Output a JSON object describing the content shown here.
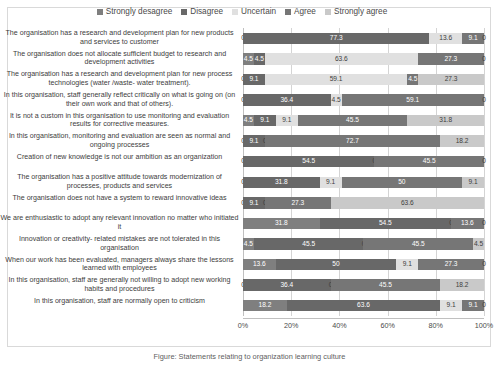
{
  "chart_data": {
    "type": "bar",
    "subtype": "stacked-horizontal-100-percent",
    "title": "",
    "xlabel": "",
    "ylabel": "",
    "xlim": [
      0,
      100
    ],
    "xticks": [
      "0%",
      "20%",
      "40%",
      "60%",
      "80%",
      "100%"
    ],
    "xtick_values": [
      0,
      20,
      40,
      60,
      80,
      100
    ],
    "grid": true,
    "legend_position": "top-center",
    "legend": [
      "Strongly desagree",
      "Disagree",
      "Uncertain",
      "Agree",
      "Strongly agree"
    ],
    "colors": [
      "#7f7f7f",
      "#686868",
      "#e0e0e0",
      "#767676",
      "#c9c9c9"
    ],
    "categories": [
      "The organisation has a research and development plan for new products and services to customer",
      "The organisation does not allocate sufficient budget to research and development activities",
      "The organisation has a research and development plan for new process technologies (water /waste- water treatment).",
      "In this organisation, staff generally reflect critically on what is going on (on their own work and that of others).",
      "It is not a custom in this organisation to use monitoring and evaluation results for corrective measures.",
      "In this organisation, monitoring and evaluation are seen as normal and ongoing processes",
      "Creation of new knowledge is not our ambition as an organization",
      "The organisation has a positive attitude towards modernization of processes, products and services",
      "The organisation does not have a system to reward innovative ideas",
      "We are enthusiastic to adopt any relevant innovation no matter who initiated it",
      "Innovation or creativity- related mistakes are not tolerated in this organisation",
      "When our work has been evaluated, managers always share the lessons learned with employees",
      "In this organisation, staff are generally not willing to adopt new working habits and procedures",
      "In this organisation, staff are normally open to criticism"
    ],
    "series": [
      {
        "name": "Strongly desagree",
        "values": [
          0,
          4.5,
          0,
          0,
          4.5,
          0,
          0,
          0,
          0,
          31.8,
          4.5,
          13.6,
          0,
          18.2
        ]
      },
      {
        "name": "Disagree",
        "values": [
          77.3,
          4.5,
          9.1,
          36.4,
          9.1,
          9.1,
          54.5,
          31.8,
          9.1,
          54.5,
          45.5,
          50,
          36.4,
          63.6
        ]
      },
      {
        "name": "Uncertain",
        "values": [
          13.6,
          63.6,
          59.1,
          4.5,
          9.1,
          0,
          0,
          9.1,
          0,
          0,
          0,
          9.1,
          0,
          9.1
        ]
      },
      {
        "name": "Agree",
        "values": [
          9.1,
          27.3,
          4.5,
          59.1,
          45.5,
          72.7,
          45.5,
          50,
          27.3,
          13.6,
          45.5,
          27.3,
          45.5,
          9.1
        ]
      },
      {
        "name": "Strongly agree",
        "values": [
          0,
          0,
          27.3,
          0,
          31.8,
          18.2,
          0,
          9.1,
          63.6,
          0,
          4.5,
          0,
          18.2,
          0
        ]
      }
    ]
  },
  "caption": "Figure: Statements relating to organization learning culture"
}
